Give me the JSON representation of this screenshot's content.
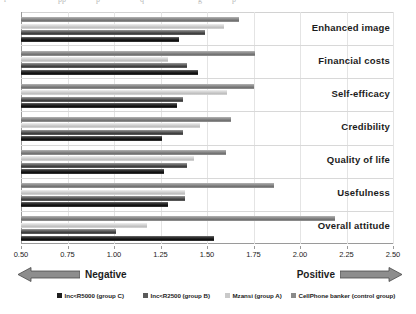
{
  "top_artifact": {
    "fragments": [
      "r",
      "pp",
      "p",
      "q",
      "g",
      "p"
    ]
  },
  "chart_data": {
    "type": "bar",
    "orientation": "horizontal",
    "title": "",
    "xlabel": "",
    "ylabel": "",
    "xlim": [
      0.5,
      2.5
    ],
    "xticks": [
      0.5,
      0.75,
      1.0,
      1.25,
      1.5,
      1.75,
      2.0,
      2.25,
      2.5
    ],
    "xtick_labels": [
      "0.50",
      "0.75",
      "1.00",
      "1.25",
      "1.50",
      "1.75",
      "2.00",
      "2.25",
      "2.50"
    ],
    "grid": true,
    "legend_position": "bottom",
    "categories": [
      "Enhanced image",
      "Financial costs",
      "Self-efficacy",
      "Credibility",
      "Quality of life",
      "Usefulness",
      "Overall attitude"
    ],
    "series": [
      {
        "name": "Inc<R5000 (group C)",
        "color": "#1f1f1f",
        "values": [
          1.35,
          1.45,
          1.34,
          1.26,
          1.27,
          1.29,
          1.54
        ]
      },
      {
        "name": "Inc<R2500 (group B)",
        "color": "#5a5a5a",
        "values": [
          1.49,
          1.39,
          1.37,
          1.37,
          1.39,
          1.38,
          1.01
        ]
      },
      {
        "name": "Mzansi (group A)",
        "color": "#c9c9c9",
        "values": [
          1.59,
          1.29,
          1.61,
          1.46,
          1.43,
          1.38,
          1.18
        ]
      },
      {
        "name": "CellPhone banker (control group)",
        "color": "#8a8a8a",
        "values": [
          1.67,
          1.76,
          1.75,
          1.63,
          1.6,
          1.86,
          2.19
        ]
      }
    ]
  },
  "scale_band": {
    "negative_label": "Negative",
    "positive_label": "Positive",
    "negative_icon": "left-arrow-icon",
    "positive_icon": "right-arrow-icon"
  }
}
